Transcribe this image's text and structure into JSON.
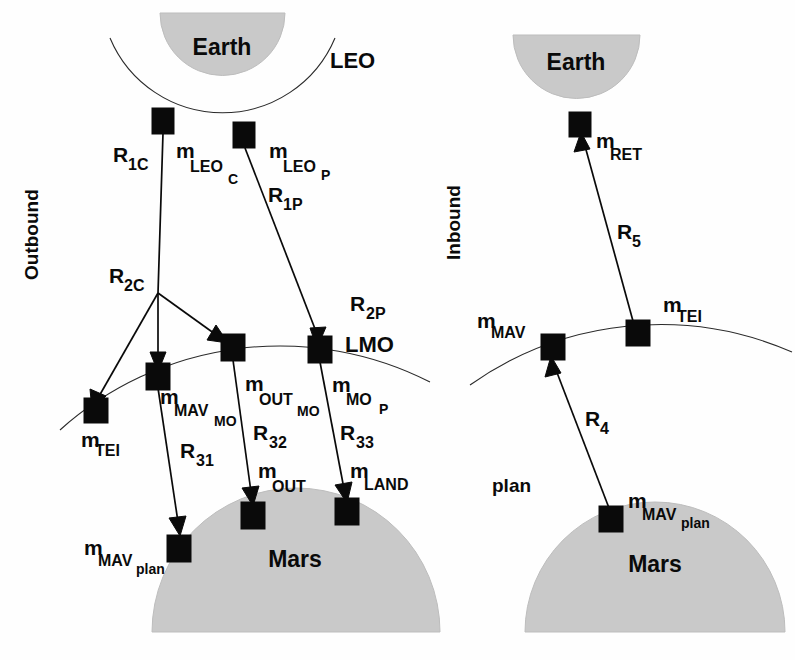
{
  "figure": {
    "type": "mission-architecture-flow-diagram",
    "panels": [
      {
        "id": "outbound",
        "side_label": "Outbound"
      },
      {
        "id": "inbound",
        "side_label": "Inbound"
      }
    ],
    "colors": {
      "planet_fill": "#c9c9c9",
      "node_fill": "#0a0a0a",
      "line": "#0a0a0a",
      "background": "#ffffff"
    }
  },
  "outbound": {
    "side_label": "Outbound",
    "earth_label": "Earth",
    "leo_label": "LEO",
    "lmo_label": "LMO",
    "mars_label": "Mars",
    "nodes": [
      {
        "id": "leo_c",
        "base": "m",
        "sub1": "LEO",
        "sub2": "C"
      },
      {
        "id": "leo_p",
        "base": "m",
        "sub1": "LEO",
        "sub2": "P"
      },
      {
        "id": "tei",
        "base": "m",
        "sub1": "TEI",
        "sub2": ""
      },
      {
        "id": "mav_mo",
        "base": "m",
        "sub1": "MAV",
        "sub2": "MO"
      },
      {
        "id": "out_mo",
        "base": "m",
        "sub1": "OUT",
        "sub2": "MO"
      },
      {
        "id": "mo_p",
        "base": "m",
        "sub1": "MO",
        "sub2": "P"
      },
      {
        "id": "mav_plan",
        "base": "m",
        "sub1": "MAV",
        "sub2": "plan"
      },
      {
        "id": "out",
        "base": "m",
        "sub1": "OUT",
        "sub2": ""
      },
      {
        "id": "land",
        "base": "m",
        "sub1": "LAND",
        "sub2": ""
      }
    ],
    "ratios": [
      {
        "id": "r1c",
        "base": "R",
        "sub1": "1C"
      },
      {
        "id": "r1p",
        "base": "R",
        "sub1": "1P"
      },
      {
        "id": "r2c",
        "base": "R",
        "sub1": "2C"
      },
      {
        "id": "r2p",
        "base": "R",
        "sub1": "2P"
      },
      {
        "id": "r31",
        "base": "R",
        "sub1": "31"
      },
      {
        "id": "r32",
        "base": "R",
        "sub1": "32"
      },
      {
        "id": "r33",
        "base": "R",
        "sub1": "33"
      }
    ]
  },
  "inbound": {
    "side_label": "Inbound",
    "earth_label": "Earth",
    "mars_label": "Mars",
    "plan_label": "plan",
    "nodes": [
      {
        "id": "ret",
        "base": "m",
        "sub1": "RET",
        "sub2": ""
      },
      {
        "id": "tei",
        "base": "m",
        "sub1": "TEI",
        "sub2": ""
      },
      {
        "id": "mav",
        "base": "m",
        "sub1": "MAV",
        "sub2": ""
      },
      {
        "id": "mav_plan",
        "base": "m",
        "sub1": "MAV",
        "sub2": "plan"
      }
    ],
    "ratios": [
      {
        "id": "r5",
        "base": "R",
        "sub1": "5"
      },
      {
        "id": "r4",
        "base": "R",
        "sub1": "4"
      }
    ]
  }
}
